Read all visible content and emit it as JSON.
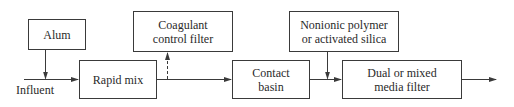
{
  "diagram": {
    "type": "process-flow",
    "nodes": {
      "alum": {
        "label": "Alum"
      },
      "rapid_mix": {
        "label": "Rapid mix"
      },
      "coagulant_control_filter": {
        "label": "Coagulant\ncontrol filter"
      },
      "contact_basin": {
        "label": "Contact\nbasin"
      },
      "nonionic_polymer": {
        "label": "Nonionic polymer\nor activated silica"
      },
      "dual_media_filter": {
        "label": "Dual or mixed\nmedia filter"
      }
    },
    "labels": {
      "influent": "Influent"
    },
    "edges": [
      {
        "from": "influent",
        "to": "rapid_mix",
        "style": "solid"
      },
      {
        "from": "alum",
        "to": "influent-line",
        "style": "solid"
      },
      {
        "from": "rapid_mix",
        "to": "contact_basin",
        "style": "solid"
      },
      {
        "from": "rapid_mix-outlet",
        "to": "coagulant_control_filter",
        "style": "dashed"
      },
      {
        "from": "contact_basin",
        "to": "dual_media_filter",
        "style": "solid"
      },
      {
        "from": "nonionic_polymer",
        "to": "contact_basin-outlet-line",
        "style": "solid"
      },
      {
        "from": "dual_media_filter",
        "to": "effluent",
        "style": "solid"
      }
    ],
    "colors": {
      "line": "#3a3a3a",
      "background": "#ffffff"
    }
  }
}
